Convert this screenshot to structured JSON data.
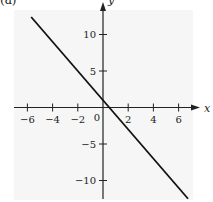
{
  "panel_label": "(a)",
  "chart_data": {
    "type": "line",
    "title": "",
    "xlabel": "x",
    "ylabel": "y",
    "xlim": [
      -7,
      7
    ],
    "ylim": [
      -12.5,
      13
    ],
    "x_ticks": [
      -6,
      -4,
      -2,
      0,
      2,
      4,
      6
    ],
    "x_tick_labels": [
      "−6",
      "−4",
      "−2",
      "0",
      "2",
      "4",
      "6"
    ],
    "y_ticks": [
      -10,
      -5,
      5,
      10
    ],
    "y_tick_labels": [
      "−10",
      "−5",
      "5",
      "10"
    ],
    "origin_label": "0",
    "grid": false,
    "legend": null,
    "series": [
      {
        "name": "y = -2x + 1",
        "slope": -2,
        "intercept": 1,
        "x": [
          -5.7,
          6.75
        ],
        "y": [
          12.4,
          -12.5
        ],
        "color": "#111111"
      }
    ]
  },
  "colors": {
    "panel_background": "#f6f6f6",
    "axis": "#222222",
    "line": "#111111"
  }
}
